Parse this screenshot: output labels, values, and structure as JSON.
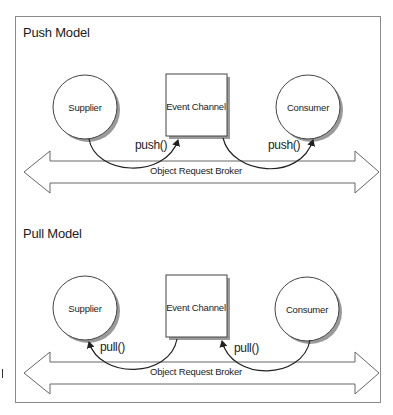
{
  "push_model": {
    "title": "Push Model",
    "supplier": "Supplier",
    "event_channel": "Event Channel",
    "consumer": "Consumer",
    "call_left": "push()",
    "call_right": "push()",
    "broker": "Object Request Broker"
  },
  "pull_model": {
    "title": "Pull Model",
    "supplier": "Supplier",
    "event_channel": "Event Channel",
    "consumer": "Consumer",
    "call_left": "pull()",
    "call_right": "pull()",
    "broker": "Object Request Broker"
  },
  "colors": {
    "stroke": "#333333",
    "frame": "#8a8a8a",
    "shadow": "#9a9a9a",
    "fill": "#ffffff"
  }
}
